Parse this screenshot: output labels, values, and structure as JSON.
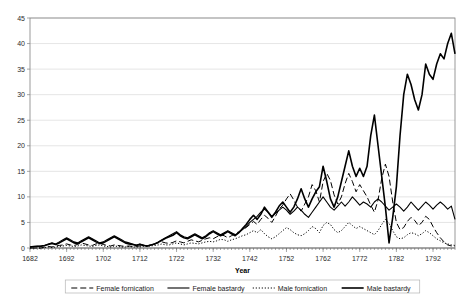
{
  "chart_data": {
    "type": "line",
    "title": "",
    "xlabel": "Year",
    "ylabel": "",
    "xlim": [
      1682,
      1798
    ],
    "ylim": [
      0,
      45
    ],
    "ytick_step": 5,
    "xtick_step": 10,
    "grid": true,
    "legend_position": "bottom",
    "xticks": [
      1682,
      1692,
      1702,
      1712,
      1722,
      1732,
      1742,
      1752,
      1762,
      1772,
      1782,
      1792
    ],
    "yticks": [
      0,
      5,
      10,
      15,
      20,
      25,
      30,
      35,
      40,
      45
    ],
    "x": [
      1682,
      1683,
      1684,
      1685,
      1686,
      1687,
      1688,
      1689,
      1690,
      1691,
      1692,
      1693,
      1694,
      1695,
      1696,
      1697,
      1698,
      1699,
      1700,
      1701,
      1702,
      1703,
      1704,
      1705,
      1706,
      1707,
      1708,
      1709,
      1710,
      1711,
      1712,
      1713,
      1714,
      1715,
      1716,
      1717,
      1718,
      1719,
      1720,
      1721,
      1722,
      1723,
      1724,
      1725,
      1726,
      1727,
      1728,
      1729,
      1730,
      1731,
      1732,
      1733,
      1734,
      1735,
      1736,
      1737,
      1738,
      1739,
      1740,
      1741,
      1742,
      1743,
      1744,
      1745,
      1746,
      1747,
      1748,
      1749,
      1750,
      1751,
      1752,
      1753,
      1754,
      1755,
      1756,
      1757,
      1758,
      1759,
      1760,
      1761,
      1762,
      1763,
      1764,
      1765,
      1766,
      1767,
      1768,
      1769,
      1770,
      1771,
      1772,
      1773,
      1774,
      1775,
      1776,
      1777,
      1778,
      1779,
      1780,
      1781,
      1782,
      1783,
      1784,
      1785,
      1786,
      1787,
      1788,
      1789,
      1790,
      1791,
      1792,
      1793,
      1794,
      1795,
      1796,
      1797,
      1798
    ],
    "series": [
      {
        "name": "Female fornication",
        "style": "dashed",
        "width": 1.0,
        "color": "#000000",
        "values": [
          0,
          0,
          0,
          0,
          0.2,
          0.3,
          0.2,
          0.4,
          0.5,
          0.6,
          0.8,
          0.6,
          0.5,
          0.7,
          1.0,
          0.8,
          0.6,
          0.5,
          0.8,
          0.9,
          0.7,
          0.5,
          0.4,
          0.6,
          0.5,
          0.4,
          0.3,
          0.4,
          0.3,
          0.3,
          0.4,
          0.5,
          0.4,
          0.6,
          0.8,
          1.0,
          1.2,
          1.0,
          0.9,
          1.1,
          1.4,
          1.2,
          1.0,
          1.3,
          1.6,
          1.4,
          1.2,
          1.5,
          1.8,
          2.0,
          1.8,
          2.2,
          2.6,
          2.4,
          2.0,
          2.4,
          2.8,
          3.2,
          3.6,
          4.0,
          4.6,
          5.2,
          4.6,
          5.6,
          6.4,
          5.8,
          5.0,
          6.2,
          7.6,
          8.4,
          9.6,
          10.6,
          9.4,
          8.0,
          7.2,
          8.6,
          10.0,
          12.4,
          11.2,
          9.0,
          13.0,
          14.6,
          13.2,
          10.4,
          8.6,
          10.0,
          12.6,
          14.6,
          13.0,
          11.0,
          12.4,
          11.2,
          10.0,
          8.4,
          7.0,
          9.4,
          13.6,
          16.4,
          14.0,
          9.0,
          5.0,
          3.6,
          4.0,
          5.2,
          6.0,
          5.4,
          4.4,
          5.0,
          6.2,
          5.6,
          4.2,
          3.0,
          2.0,
          1.2,
          0.6,
          0.4,
          0.3
        ]
      },
      {
        "name": "Female bastardy",
        "style": "solid-thin",
        "width": 1.1,
        "color": "#000000",
        "values": [
          0.2,
          0.3,
          0.4,
          0.3,
          0.5,
          0.8,
          1.0,
          0.8,
          1.2,
          1.6,
          2.0,
          1.6,
          1.2,
          1.0,
          1.4,
          1.8,
          2.2,
          1.8,
          1.4,
          1.0,
          1.2,
          1.6,
          2.0,
          2.4,
          2.0,
          1.6,
          1.2,
          1.0,
          0.8,
          0.6,
          0.8,
          0.6,
          0.4,
          0.6,
          0.8,
          1.2,
          1.6,
          2.0,
          2.4,
          2.8,
          3.2,
          2.6,
          2.2,
          2.0,
          2.4,
          2.8,
          2.4,
          2.0,
          2.4,
          3.0,
          3.4,
          3.0,
          2.6,
          3.0,
          3.4,
          3.0,
          2.6,
          3.0,
          3.6,
          4.2,
          5.0,
          5.6,
          6.2,
          7.0,
          7.6,
          7.0,
          6.2,
          6.8,
          7.4,
          8.0,
          7.4,
          6.6,
          7.2,
          8.0,
          7.4,
          6.6,
          6.0,
          7.0,
          8.0,
          9.0,
          10.0,
          9.0,
          8.0,
          7.4,
          8.2,
          9.0,
          8.2,
          9.0,
          10.0,
          9.2,
          8.4,
          9.0,
          8.6,
          8.0,
          9.0,
          9.6,
          9.0,
          8.2,
          7.4,
          8.0,
          8.6,
          8.0,
          7.2,
          8.0,
          9.0,
          8.2,
          7.4,
          8.2,
          9.0,
          8.4,
          7.6,
          8.4,
          9.0,
          8.4,
          7.6,
          8.2,
          5.6
        ]
      },
      {
        "name": "Male fornication",
        "style": "dotted",
        "width": 1.0,
        "color": "#000000",
        "values": [
          0,
          0,
          0,
          0,
          0.1,
          0.2,
          0.1,
          0.2,
          0.3,
          0.4,
          0.5,
          0.4,
          0.3,
          0.4,
          0.6,
          0.5,
          0.4,
          0.3,
          0.5,
          0.6,
          0.4,
          0.3,
          0.2,
          0.4,
          0.3,
          0.2,
          0.2,
          0.3,
          0.2,
          0.2,
          0.2,
          0.3,
          0.3,
          0.4,
          0.5,
          0.6,
          0.8,
          0.6,
          0.6,
          0.8,
          1.0,
          0.8,
          0.6,
          0.8,
          1.0,
          0.9,
          0.8,
          1.0,
          1.2,
          1.3,
          1.2,
          1.4,
          1.7,
          1.6,
          1.3,
          1.6,
          1.8,
          2.1,
          2.4,
          2.6,
          3.0,
          3.4,
          3.0,
          3.6,
          2.8,
          2.2,
          1.8,
          2.2,
          2.8,
          3.4,
          4.0,
          3.6,
          3.0,
          2.6,
          2.4,
          2.8,
          3.4,
          4.2,
          3.8,
          3.0,
          4.4,
          5.0,
          4.6,
          3.6,
          3.0,
          3.4,
          4.2,
          5.0,
          4.4,
          3.8,
          4.2,
          3.8,
          3.4,
          3.0,
          2.6,
          3.4,
          4.6,
          5.6,
          4.8,
          3.4,
          2.2,
          1.8,
          2.0,
          2.6,
          3.0,
          2.8,
          2.4,
          2.8,
          3.4,
          3.0,
          2.4,
          1.8,
          1.4,
          1.0,
          0.8,
          0.6,
          0.5
        ]
      },
      {
        "name": "Male bastardy",
        "style": "solid-thick",
        "width": 1.6,
        "color": "#000000",
        "values": [
          0.2,
          0.3,
          0.3,
          0.4,
          0.5,
          0.7,
          0.9,
          0.7,
          1.0,
          1.4,
          1.8,
          1.4,
          1.0,
          0.9,
          1.2,
          1.6,
          2.0,
          1.6,
          1.2,
          0.9,
          1.0,
          1.4,
          1.8,
          2.2,
          1.8,
          1.4,
          1.0,
          0.8,
          0.7,
          0.5,
          0.7,
          0.5,
          0.4,
          0.6,
          0.8,
          1.1,
          1.5,
          1.9,
          2.2,
          2.5,
          3.0,
          2.4,
          2.0,
          1.8,
          2.2,
          2.6,
          2.2,
          1.8,
          2.2,
          2.8,
          3.2,
          2.8,
          2.4,
          2.8,
          3.2,
          2.8,
          2.4,
          3.0,
          3.8,
          4.6,
          5.6,
          6.4,
          5.6,
          6.6,
          8.0,
          7.0,
          6.0,
          7.0,
          8.2,
          9.0,
          8.0,
          7.0,
          8.0,
          9.6,
          11.6,
          9.6,
          8.0,
          9.6,
          11.0,
          12.0,
          16.0,
          13.0,
          9.6,
          8.0,
          10.0,
          13.0,
          16.0,
          19.0,
          16.0,
          14.0,
          15.6,
          14.0,
          16.0,
          22.0,
          26.0,
          20.0,
          14.0,
          8.0,
          1.0,
          6.0,
          12.0,
          22.0,
          30.0,
          34.0,
          32.0,
          29.0,
          27.0,
          30.0,
          36.0,
          34.0,
          33.0,
          36.0,
          38.0,
          37.0,
          40.0,
          42.0,
          38.0
        ]
      }
    ]
  },
  "legend": {
    "items": [
      {
        "label": "Female fornication",
        "style": "dashed"
      },
      {
        "label": "Female bastardy",
        "style": "solid-thin"
      },
      {
        "label": "Male fornication",
        "style": "dotted"
      },
      {
        "label": "Male bastardy",
        "style": "solid-thick"
      }
    ]
  }
}
